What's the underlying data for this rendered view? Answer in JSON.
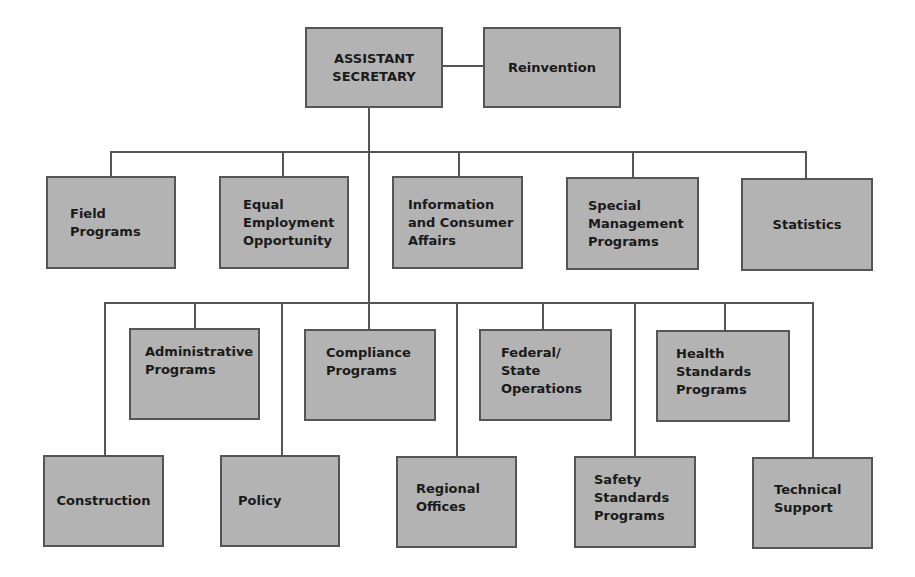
{
  "chart": {
    "root": {
      "label": "ASSISTANT\nSECRETARY"
    },
    "staff": {
      "label": "Reinvention"
    },
    "level1": [
      {
        "label": "Field\nPrograms"
      },
      {
        "label": "Equal\nEmployment\nOpportunity"
      },
      {
        "label": "Information\nand Consumer\nAffairs"
      },
      {
        "label": "Special\nManagement\nPrograms"
      },
      {
        "label": "Statistics"
      }
    ],
    "level2_upper": [
      {
        "label": "Administrative\nPrograms"
      },
      {
        "label": "Compliance\nPrograms"
      },
      {
        "label": "Federal/\nState\nOperations"
      },
      {
        "label": "Health\nStandards\nPrograms"
      }
    ],
    "level2_lower": [
      {
        "label": "Construction"
      },
      {
        "label": "Policy"
      },
      {
        "label": "Regional\nOffices"
      },
      {
        "label": "Safety\nStandards\nPrograms"
      },
      {
        "label": "Technical\nSupport"
      }
    ]
  }
}
